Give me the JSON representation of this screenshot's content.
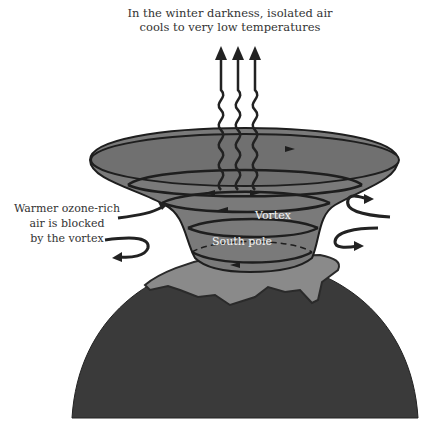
{
  "diagram": {
    "top_caption_line1": "In the winter darkness, isolated air",
    "top_caption_line2": "cools to very low temperatures",
    "left_caption_line1": "Warmer ozone-rich",
    "left_caption_line2": "air is blocked",
    "left_caption_line3": "by the vortex",
    "vortex_label": "Vortex",
    "pole_label": "South pole"
  },
  "colors": {
    "earth": "#3a3a3a",
    "antarctica": "#8a8a8a",
    "vortex_fill": "#7a7a7a",
    "outline": "#1e1e1e"
  }
}
